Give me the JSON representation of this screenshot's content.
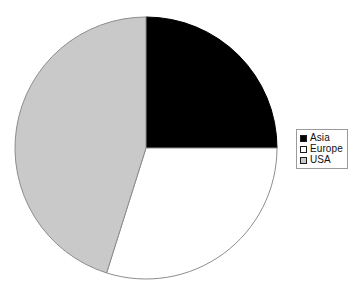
{
  "chart_data": {
    "type": "pie",
    "title": "",
    "subtitle": "",
    "xlabel": "",
    "ylabel": "",
    "grid": false,
    "legend_position": "right",
    "start_angle_deg": 0,
    "direction": "clockwise",
    "categories": [
      "Asia",
      "Europe",
      "USA"
    ],
    "values": [
      25,
      30,
      45
    ],
    "units": "percent",
    "colors": [
      "#000000",
      "#ffffff",
      "#c9c9c9"
    ],
    "slices": [
      {
        "label": "Asia",
        "value": 25,
        "percent": 25,
        "angle_deg": 90,
        "start_deg": 0,
        "end_deg": 90,
        "color": "#000000",
        "edge_color": "#000000"
      },
      {
        "label": "Europe",
        "value": 30,
        "percent": 30,
        "angle_deg": 107.5,
        "start_deg": 90,
        "end_deg": 197.5,
        "color": "#ffffff",
        "edge_color": "#8c8c8c"
      },
      {
        "label": "USA",
        "value": 45,
        "percent": 45,
        "angle_deg": 162.5,
        "start_deg": 197.5,
        "end_deg": 360,
        "color": "#c9c9c9",
        "edge_color": "#8c8c8c"
      }
    ],
    "geometry": {
      "center_x": 146,
      "center_y": 148,
      "radius": 131
    }
  },
  "legend": {
    "items": [
      {
        "label": "Asia",
        "swatch_color": "#000000",
        "swatch_border": "#1a1a1a"
      },
      {
        "label": "Europe",
        "swatch_color": "#ffffff",
        "swatch_border": "#1a1a1a"
      },
      {
        "label": "USA",
        "swatch_color": "#c9c9c9",
        "swatch_border": "#1a1a1a"
      }
    ],
    "border_color": "#9a9a9a",
    "background": "#ffffff"
  },
  "canvas": {
    "background": "#ffffff",
    "width": 359,
    "height": 298
  }
}
